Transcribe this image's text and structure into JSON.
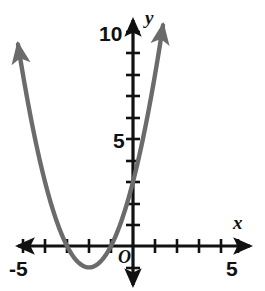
{
  "figure": {
    "kind": "cartesian-graph",
    "width": 265,
    "height": 291,
    "background": "#ffffff"
  },
  "labels": {
    "y_ten": "10",
    "y_five": "5",
    "x_neg_five": "-5",
    "x_five": "5",
    "origin": "O",
    "axis_x": "x",
    "axis_y": "y"
  },
  "colors": {
    "axis": "#111111",
    "curve": "#6b6b6b",
    "text": "#111111",
    "background": "#ffffff"
  },
  "chart_data": {
    "type": "line",
    "title": "",
    "xlabel": "x",
    "ylabel": "y",
    "xlim": [
      -5.6,
      5.6
    ],
    "ylim": [
      -1.9,
      10.9
    ],
    "grid": false,
    "legend": null,
    "axis_origin_label": "O",
    "x_tick_labels": [
      {
        "value": -5,
        "text": "-5"
      },
      {
        "value": 5,
        "text": "5"
      }
    ],
    "y_tick_labels": [
      {
        "value": 5,
        "text": "5"
      },
      {
        "value": 10,
        "text": "10"
      }
    ],
    "x_ticks": [
      -5,
      -4,
      -3,
      -2,
      -1,
      1,
      2,
      3,
      4,
      5
    ],
    "y_ticks": [
      -1,
      1,
      2,
      3,
      4,
      5,
      6,
      7,
      8,
      9,
      10
    ],
    "tick_step": 1,
    "series": [
      {
        "name": "parabola",
        "equation": "y = (x + 2)^2 - 1",
        "vertex": [
          -2,
          -1
        ],
        "roots": [
          -3,
          -1
        ],
        "y_intercept": 3,
        "color": "#6b6b6b",
        "arrow_ends": "both",
        "x": [
          -5.0,
          -4.75,
          -4.5,
          -4.25,
          -4.0,
          -3.75,
          -3.5,
          -3.25,
          -3.0,
          -2.75,
          -2.5,
          -2.25,
          -2.0,
          -1.75,
          -1.5,
          -1.25,
          -1.0,
          -0.75,
          -0.5,
          -0.25,
          0.0,
          0.25,
          0.5,
          0.75,
          1.0,
          1.25
        ],
        "y": [
          8.0,
          6.5625,
          5.25,
          4.0625,
          3.0,
          2.0625,
          1.25,
          0.5625,
          0.0,
          -0.4375,
          -0.75,
          -0.9375,
          -1.0,
          -0.9375,
          -0.75,
          -0.4375,
          0.0,
          0.5625,
          1.25,
          2.0625,
          3.0,
          4.0625,
          5.25,
          6.5625,
          8.0,
          9.5625
        ]
      }
    ]
  }
}
